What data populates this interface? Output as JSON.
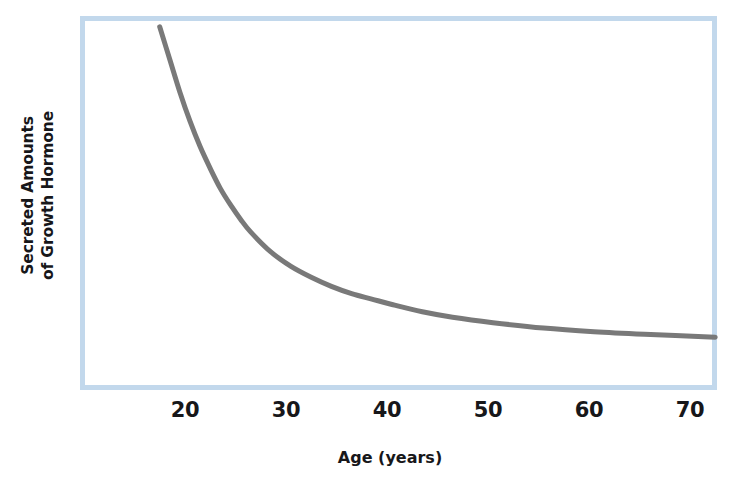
{
  "chart_data": {
    "type": "line",
    "title": "",
    "subtitle": "",
    "xlabel": "Age (years)",
    "ylabel_line1": "Secreted Amounts",
    "ylabel_line2": "of Growth Hormone",
    "ylabel": "Secreted Amounts of Growth Hormone",
    "xtick_labels": [
      "20",
      "30",
      "40",
      "50",
      "60",
      "70"
    ],
    "xtick_values": [
      20,
      30,
      40,
      50,
      60,
      70
    ],
    "ytick_labels": [],
    "xlim": [
      17,
      72
    ],
    "ylim": [
      0,
      100
    ],
    "grid": false,
    "legend": null,
    "annotations": [],
    "series": [
      {
        "name": "Secreted Amounts of Growth Hormone",
        "color": "#797979",
        "line_width": 5,
        "x": [
          17,
          18,
          19,
          20,
          21,
          22,
          23,
          24,
          25,
          26,
          28,
          30,
          32,
          34,
          36,
          38,
          40,
          43,
          46,
          50,
          55,
          60,
          65,
          72
        ],
        "y": [
          99.5,
          90.5,
          81.5,
          73.5,
          66.5,
          60.5,
          55.0,
          50.5,
          46.5,
          43.0,
          37.5,
          33.5,
          30.5,
          28.0,
          26.0,
          24.5,
          23.0,
          21.0,
          19.5,
          18.0,
          16.5,
          15.5,
          14.8,
          14.0
        ]
      }
    ]
  },
  "style": {
    "frame_color": "#c2d8ec",
    "curve_color": "#797979",
    "text_color": "#17171a",
    "background": "#ffffff"
  }
}
